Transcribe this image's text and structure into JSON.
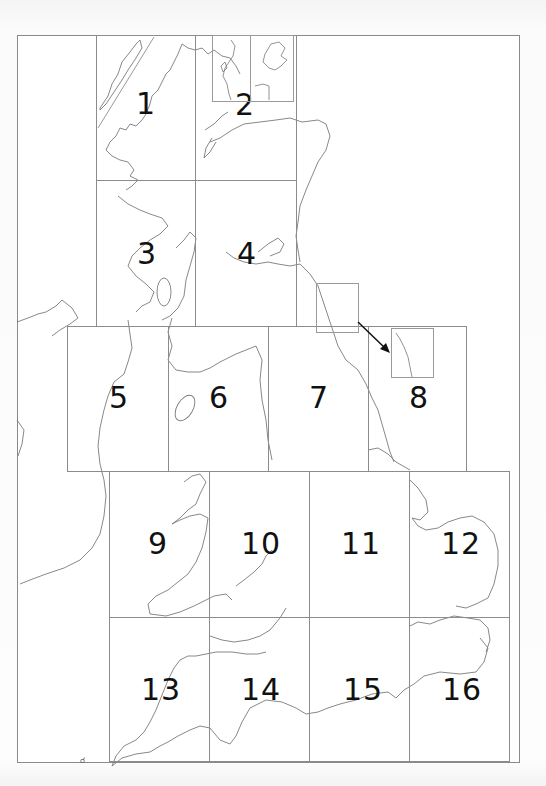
{
  "map": {
    "title": "",
    "type": "index-grid",
    "subject": "Great Britain sheet index",
    "line_color": "#8c8c8c",
    "coast_color": "#777777",
    "label_color": "#111111",
    "tiles": [
      {
        "id": "1",
        "label": "1",
        "x": 96,
        "y": 35,
        "w": 99,
        "h": 145,
        "lx": 145,
        "ly": 102
      },
      {
        "id": "2",
        "label": "2",
        "x": 195,
        "y": 35,
        "w": 101,
        "h": 145,
        "lx": 244,
        "ly": 103
      },
      {
        "id": "3",
        "label": "3",
        "x": 96,
        "y": 180,
        "w": 99,
        "h": 146,
        "lx": 146,
        "ly": 252
      },
      {
        "id": "4",
        "label": "4",
        "x": 195,
        "y": 180,
        "w": 101,
        "h": 146,
        "lx": 246,
        "ly": 252
      },
      {
        "id": "5",
        "label": "5",
        "x": 67,
        "y": 326,
        "w": 101,
        "h": 145,
        "lx": 118,
        "ly": 396
      },
      {
        "id": "6",
        "label": "6",
        "x": 168,
        "y": 326,
        "w": 100,
        "h": 145,
        "lx": 218,
        "ly": 396
      },
      {
        "id": "7",
        "label": "7",
        "x": 268,
        "y": 326,
        "w": 100,
        "h": 145,
        "lx": 318,
        "ly": 396
      },
      {
        "id": "8",
        "label": "8",
        "x": 368,
        "y": 326,
        "w": 98,
        "h": 145,
        "lx": 418,
        "ly": 396
      },
      {
        "id": "9",
        "label": "9",
        "x": 109,
        "y": 471,
        "w": 100,
        "h": 146,
        "lx": 157,
        "ly": 542
      },
      {
        "id": "10",
        "label": "10",
        "x": 209,
        "y": 471,
        "w": 100,
        "h": 146,
        "lx": 260,
        "ly": 542
      },
      {
        "id": "11",
        "label": "11",
        "x": 309,
        "y": 471,
        "w": 100,
        "h": 146,
        "lx": 360,
        "ly": 542
      },
      {
        "id": "12",
        "label": "12",
        "x": 409,
        "y": 471,
        "w": 100,
        "h": 146,
        "lx": 460,
        "ly": 542
      },
      {
        "id": "13",
        "label": "13",
        "x": 109,
        "y": 617,
        "w": 100,
        "h": 144,
        "lx": 160,
        "ly": 688
      },
      {
        "id": "14",
        "label": "14",
        "x": 209,
        "y": 617,
        "w": 100,
        "h": 144,
        "lx": 260,
        "ly": 688
      },
      {
        "id": "15",
        "label": "15",
        "x": 309,
        "y": 617,
        "w": 100,
        "h": 144,
        "lx": 362,
        "ly": 688
      },
      {
        "id": "16",
        "label": "16",
        "x": 409,
        "y": 617,
        "w": 100,
        "h": 144,
        "lx": 461,
        "ly": 688
      }
    ],
    "insets": [
      {
        "name": "outer-hebrides-inset",
        "note": "diagonal inset in sheet 1"
      },
      {
        "name": "shetland-inset",
        "x": 212,
        "y": 35,
        "w": 38,
        "h": 67
      },
      {
        "name": "orkney-inset",
        "x": 250,
        "y": 35,
        "w": 43,
        "h": 67
      },
      {
        "name": "northumberland-source-box",
        "x": 316,
        "y": 283,
        "w": 42,
        "h": 50
      },
      {
        "name": "northumberland-inset-in-8",
        "x": 391,
        "y": 328,
        "w": 42,
        "h": 50
      }
    ],
    "arrow": {
      "from": [
        358,
        322
      ],
      "to": [
        390,
        352
      ],
      "meaning": "inset relocation arrow"
    },
    "small_mark": "Scilly Isles glyph"
  }
}
